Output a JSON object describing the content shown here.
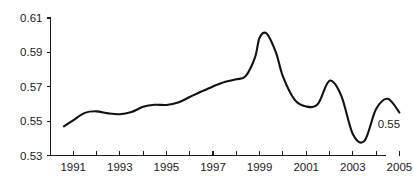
{
  "chart_data": {
    "type": "line",
    "title": "",
    "subtitle": "",
    "xlabel": "",
    "ylabel": "",
    "xlim": [
      1990.6,
      2005.0
    ],
    "ylim": [
      0.53,
      0.61
    ],
    "grid": false,
    "legend": null,
    "y_ticks": [
      "0.61",
      "0.59",
      "0.57",
      "0.55",
      "0.53"
    ],
    "y_tick_values": [
      0.61,
      0.59,
      0.57,
      0.55,
      0.53
    ],
    "x_ticks": [
      "1991",
      "1993",
      "1995",
      "1997",
      "1999",
      "2001",
      "2003",
      "2005"
    ],
    "x_tick_values": [
      1991,
      1993,
      1995,
      1997,
      1999,
      2001,
      2003,
      2005
    ],
    "x_minor_tick_values": [
      1992,
      1994,
      1996,
      1998,
      2000,
      2002,
      2004
    ],
    "series": [
      {
        "name": "value",
        "x": [
          1990.6,
          1991.0,
          1991.5,
          1992.0,
          1992.5,
          1993.0,
          1993.5,
          1994.0,
          1994.5,
          1995.0,
          1995.5,
          1996.0,
          1996.5,
          1997.0,
          1997.5,
          1998.0,
          1998.4,
          1998.8,
          1999.0,
          1999.3,
          1999.7,
          2000.0,
          2000.5,
          2001.0,
          2001.5,
          2002.0,
          2002.5,
          2003.0,
          2003.5,
          2004.0,
          2004.5,
          2005.0
        ],
        "y": [
          0.547,
          0.5505,
          0.5548,
          0.5557,
          0.5545,
          0.554,
          0.5553,
          0.5583,
          0.5595,
          0.5594,
          0.5608,
          0.564,
          0.5672,
          0.5702,
          0.5728,
          0.5743,
          0.5762,
          0.587,
          0.5985,
          0.601,
          0.59,
          0.576,
          0.5625,
          0.5585,
          0.56,
          0.5735,
          0.565,
          0.5425,
          0.5385,
          0.557,
          0.563,
          0.555
        ]
      }
    ],
    "annotations": [
      {
        "text": "0.55",
        "x": 2004.55,
        "y": 0.546
      }
    ],
    "colors": {
      "line": "#111111",
      "axis": "#1a1a1a",
      "background": "#ffffff",
      "text": "#1a1a1a"
    }
  }
}
